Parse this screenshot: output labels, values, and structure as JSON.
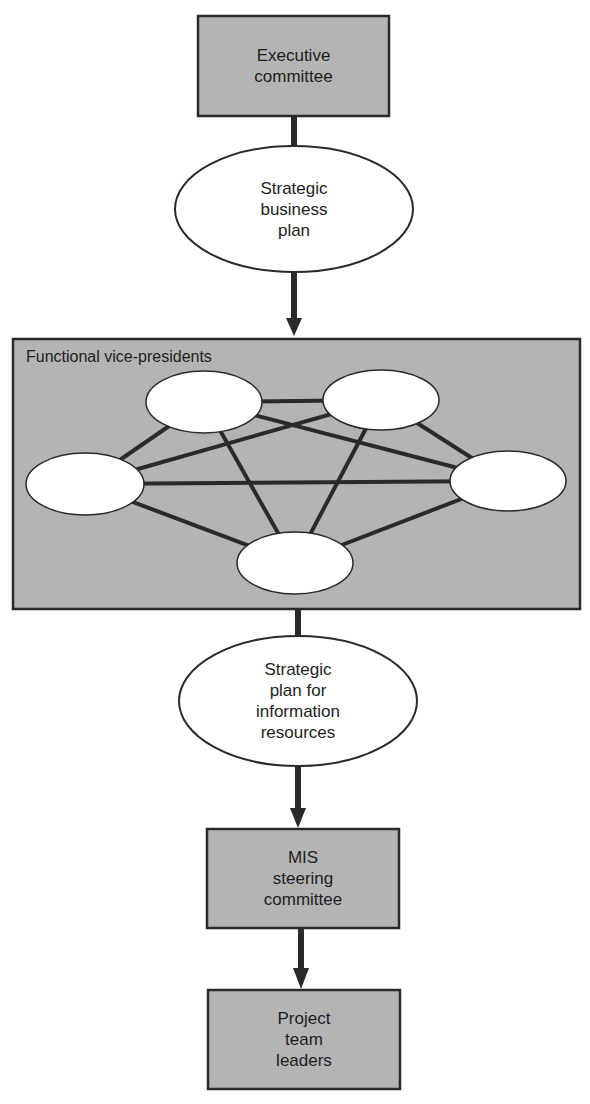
{
  "diagram": {
    "type": "flowchart",
    "colors": {
      "box_fill": "#b4b4b4",
      "stroke": "#2a2a2a",
      "ellipse_fill": "#ffffff"
    },
    "nodes": {
      "executive_committee": {
        "label": "Executive\ncommittee",
        "shape": "rectangle"
      },
      "strategic_business_plan": {
        "label": "Strategic\nbusiness\nplan",
        "shape": "ellipse"
      },
      "functional_vps": {
        "label": "Functional vice-presidents",
        "shape": "rectangle-group",
        "members": [
          "vp-1",
          "vp-2",
          "vp-3",
          "vp-4",
          "vp-5"
        ],
        "connections": "fully-connected"
      },
      "strategic_plan_info": {
        "label": "Strategic\nplan for\ninformation\nresources",
        "shape": "ellipse"
      },
      "mis_steering": {
        "label": "MIS\nsteering\ncommittee",
        "shape": "rectangle"
      },
      "project_team_leaders": {
        "label": "Project\nteam\nleaders",
        "shape": "rectangle"
      }
    },
    "edges": [
      [
        "executive_committee",
        "strategic_business_plan",
        "line"
      ],
      [
        "strategic_business_plan",
        "functional_vps",
        "arrow"
      ],
      [
        "functional_vps",
        "strategic_plan_info",
        "line"
      ],
      [
        "strategic_plan_info",
        "mis_steering",
        "arrow"
      ],
      [
        "mis_steering",
        "project_team_leaders",
        "arrow"
      ]
    ]
  }
}
